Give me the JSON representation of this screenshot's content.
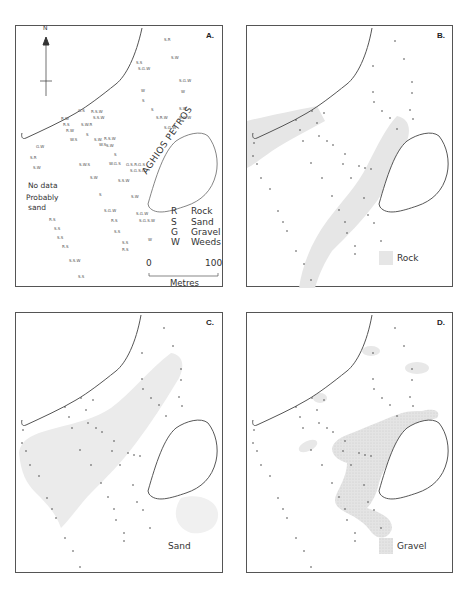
{
  "figure": {
    "panels": [
      {
        "id": "A",
        "label": "A."
      },
      {
        "id": "B",
        "label": "B."
      },
      {
        "id": "C",
        "label": "C."
      },
      {
        "id": "D",
        "label": "D."
      }
    ],
    "north_label": "N",
    "island_label": "AGHIOS PETROS",
    "no_data_lines": [
      "No data",
      "Probably",
      "sand"
    ],
    "key": [
      {
        "code": "R",
        "meaning": "Rock"
      },
      {
        "code": "S",
        "meaning": "Sand"
      },
      {
        "code": "G",
        "meaning": "Gravel"
      },
      {
        "code": "W",
        "meaning": "Weeds"
      }
    ],
    "scale": {
      "start": "0",
      "end": "100",
      "unit": "Metres"
    },
    "legends": {
      "B": "Rock",
      "C": "Sand",
      "D": "Gravel"
    },
    "colors": {
      "outline": "#555555",
      "fill_shade": "#e6e6e6",
      "station_dot": "#444444"
    }
  }
}
